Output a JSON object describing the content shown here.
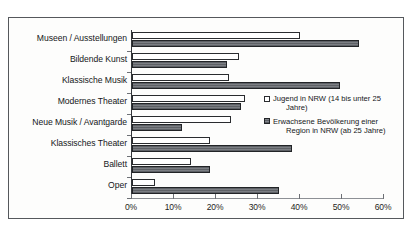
{
  "chart_data": {
    "type": "bar",
    "orientation": "horizontal",
    "title": "",
    "xlabel": "",
    "ylabel": "",
    "xlim": [
      0,
      60
    ],
    "xticks": [
      "0%",
      "10%",
      "20%",
      "30%",
      "40%",
      "50%",
      "60%"
    ],
    "xtick_values": [
      0,
      10,
      20,
      30,
      40,
      50,
      60
    ],
    "grid": false,
    "legend_position": "center-right",
    "categories": [
      "Museen / Ausstellungen",
      "Bildende Kunst",
      "Klassische Musik",
      "Modernes Theater",
      "Neue Musik / Avantgarde",
      "Klassisches Theater",
      "Ballett",
      "Oper"
    ],
    "series": [
      {
        "name": "Jugend in NRW (14 bis unter 25 Jahre)",
        "color": "#ffffff",
        "values": [
          40,
          25.5,
          23,
          27,
          23.5,
          18.5,
          14,
          5.5
        ]
      },
      {
        "name": "Erwachsene Bevölkerung einer Region in NRW (ab 25 Jahre)",
        "color": "#6e7176",
        "values": [
          54,
          22.5,
          49.5,
          26,
          12,
          38,
          18.5,
          35
        ]
      }
    ]
  },
  "legend": {
    "entries": [
      {
        "line1": "Jugend in NRW (14 bis unter 25",
        "line2": "Jahre)",
        "swatch": "youth"
      },
      {
        "line1": "Erwachsene Bevölkerung einer",
        "line2": "Region in NRW (ab 25 Jahre)",
        "swatch": "adult"
      }
    ]
  }
}
